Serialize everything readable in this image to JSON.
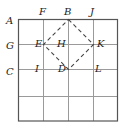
{
  "diagram": {
    "type": "grid-with-dashed-square",
    "grid": {
      "rows": 4,
      "cols": 4,
      "x0": 18,
      "y0": 19,
      "cell": 25
    },
    "colors": {
      "grid": "#9a9a9a",
      "border": "#555555",
      "dashed": "#444444",
      "text": "#222222"
    },
    "labels": {
      "A": "A",
      "B": "B",
      "C": "C",
      "D": "D",
      "E": "E",
      "F": "F",
      "G": "G",
      "H": "H",
      "I": "I",
      "J": "J",
      "K": "K",
      "L": "L"
    },
    "dashed_square_vertices": [
      "B",
      "K",
      "D",
      "E"
    ]
  }
}
